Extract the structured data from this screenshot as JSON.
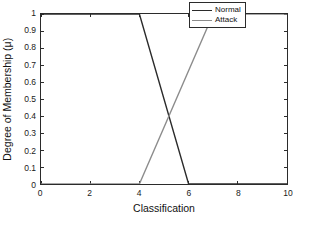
{
  "chart_data": {
    "type": "line",
    "title": "",
    "xlabel": "Classification",
    "ylabel": "Degree of Membership (μ)",
    "xlim": [
      0,
      10
    ],
    "ylim": [
      0,
      1
    ],
    "grid": false,
    "legend_position": "top-right-inside",
    "xticks": [
      "0",
      "2",
      "4",
      "6",
      "8",
      "10"
    ],
    "xtick_values": [
      0,
      2,
      4,
      6,
      8,
      10
    ],
    "yticks": [
      "0",
      "0.1",
      "0.2",
      "0.3",
      "0.4",
      "0.5",
      "0.6",
      "0.7",
      "0.8",
      "0.9",
      "1"
    ],
    "ytick_values": [
      0,
      0.1,
      0.2,
      0.3,
      0.4,
      0.5,
      0.6,
      0.7,
      0.8,
      0.9,
      1
    ],
    "series": [
      {
        "name": "Normal",
        "color": "#2b2b2b",
        "x": [
          0,
          4,
          6,
          10
        ],
        "y": [
          1,
          1,
          0,
          0
        ]
      },
      {
        "name": "Attack",
        "color": "#8c8c8c",
        "x": [
          0,
          4,
          7,
          10
        ],
        "y": [
          0,
          0,
          1,
          1
        ]
      }
    ],
    "annotations": []
  },
  "legend": {
    "entries": [
      {
        "label": "Normal",
        "color": "#2b2b2b"
      },
      {
        "label": "Attack",
        "color": "#8c8c8c"
      }
    ]
  },
  "axes": {
    "x_title": "Classification",
    "y_title": "Degree of Membership (μ)"
  }
}
